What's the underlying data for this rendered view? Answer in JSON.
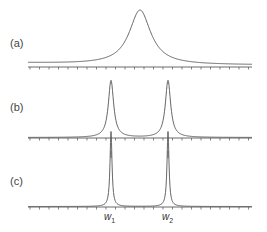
{
  "chart_data": [
    {
      "type": "line",
      "panel": "(a)",
      "title": "",
      "xlabel": "",
      "ylabel": "",
      "description": "Single broad Lorentzian-like peak centered between w1 and w2",
      "series": [
        {
          "name": "spectrum",
          "center": 0.5,
          "width": "broad",
          "peak_height": 1.0
        }
      ],
      "grid": false,
      "axis_ticks": "minor ticks evenly spaced, unlabeled"
    },
    {
      "type": "line",
      "panel": "(b)",
      "title": "",
      "xlabel": "",
      "ylabel": "",
      "description": "Two resolved peaks at w1 and w2 with moderate width",
      "series": [
        {
          "name": "spectrum",
          "peaks": [
            {
              "position": "w1",
              "width": "medium",
              "height": 1.0
            },
            {
              "position": "w2",
              "width": "medium",
              "height": 1.0
            }
          ]
        }
      ],
      "grid": false,
      "axis_ticks": "minor ticks evenly spaced, longer ticks below axis at w1 and w2"
    },
    {
      "type": "line",
      "panel": "(c)",
      "title": "",
      "xlabel": "",
      "ylabel": "",
      "description": "Two sharp narrow peaks at w1 and w2",
      "series": [
        {
          "name": "spectrum",
          "peaks": [
            {
              "position": "w1",
              "width": "narrow",
              "height": 1.0
            },
            {
              "position": "w2",
              "width": "narrow",
              "height": 1.0
            }
          ]
        }
      ],
      "grid": false,
      "tick_labels": [
        "w1",
        "w2"
      ]
    }
  ],
  "labels": {
    "panel_a": "(a)",
    "panel_b": "(b)",
    "panel_c": "(c)",
    "w1_base": "w",
    "w1_sub": "1",
    "w2_base": "w",
    "w2_sub": "2"
  },
  "colors": {
    "curve": "#555555",
    "axis": "#444444"
  }
}
